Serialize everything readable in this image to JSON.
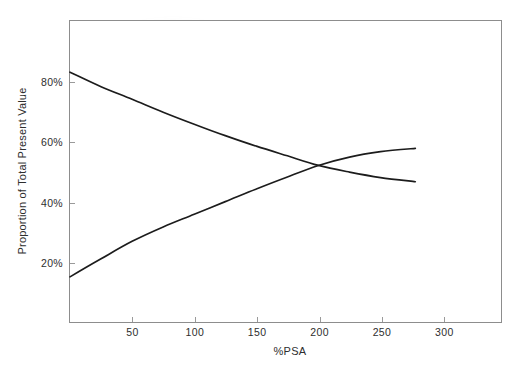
{
  "chart_data": {
    "type": "line",
    "title": "",
    "xlabel": "%PSA",
    "ylabel": "Proportion of Total Present Value",
    "xlim": [
      0,
      347
    ],
    "ylim": [
      0,
      100
    ],
    "grid": false,
    "legend": "none",
    "frame_color": "#8d8d8d",
    "tick_color": "#9a9a9a",
    "line_color": "#1c1c1c",
    "text_color": "#2e2e2e",
    "x_ticks": [
      {
        "value": 50,
        "label": "50"
      },
      {
        "value": 100,
        "label": "100"
      },
      {
        "value": 150,
        "label": "150"
      },
      {
        "value": 200,
        "label": "200"
      },
      {
        "value": 250,
        "label": "250"
      },
      {
        "value": 300,
        "label": "300"
      }
    ],
    "y_ticks": [
      {
        "value": 20,
        "label": "20%"
      },
      {
        "value": 40,
        "label": "40%"
      },
      {
        "value": 60,
        "label": "60%"
      },
      {
        "value": 80,
        "label": "80%"
      }
    ],
    "series": [
      {
        "name": "falling",
        "x": [
          0,
          25,
          50,
          75,
          100,
          125,
          150,
          175,
          200,
          225,
          250,
          278
        ],
        "y": [
          83,
          78.2,
          74,
          69.7,
          65.7,
          61.9,
          58.4,
          55.2,
          52,
          49.8,
          48,
          46.6
        ]
      },
      {
        "name": "rising",
        "x": [
          0,
          25,
          50,
          75,
          100,
          125,
          150,
          175,
          200,
          225,
          250,
          278
        ],
        "y": [
          15,
          21,
          26.8,
          31.6,
          35.8,
          40,
          44.2,
          48.2,
          52,
          54.8,
          56.6,
          57.7
        ]
      }
    ]
  }
}
